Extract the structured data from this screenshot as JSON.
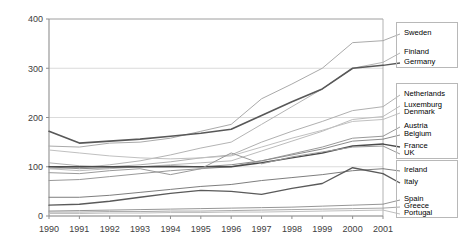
{
  "chart_data": {
    "type": "line",
    "title": "",
    "xlabel": "",
    "ylabel": "",
    "x": [
      1990,
      1991,
      1992,
      1993,
      1994,
      1995,
      1996,
      1997,
      1998,
      1999,
      2000,
      2001
    ],
    "categories": [
      "1990",
      "1991",
      "1992",
      "1993",
      "1994",
      "1995",
      "1996",
      "1997",
      "1998",
      "1999",
      "2000",
      "2001"
    ],
    "ylim": [
      0,
      400
    ],
    "xlim": [
      1990,
      2001
    ],
    "yticks": [
      0,
      100,
      200,
      300,
      400
    ],
    "ytick_labels": [
      "0",
      "100",
      "200",
      "300",
      "400"
    ],
    "grid": true,
    "legend_position": "right",
    "series": [
      {
        "name": "Sweden",
        "color": "#aaaaaa",
        "width": 1.0,
        "values": [
          142,
          140,
          148,
          150,
          158,
          172,
          186,
          238,
          268,
          300,
          352,
          356
        ]
      },
      {
        "name": "Finland",
        "color": "#b4b4b4",
        "width": 1.0,
        "values": [
          96,
          98,
          104,
          112,
          124,
          138,
          150,
          186,
          222,
          258,
          300,
          312
        ]
      },
      {
        "name": "Germany",
        "color": "#585858",
        "width": 1.6,
        "values": [
          172,
          148,
          152,
          156,
          162,
          168,
          176,
          204,
          232,
          258,
          300,
          306
        ]
      },
      {
        "name": "Netherlands",
        "color": "#b0b0b0",
        "width": 1.0,
        "values": [
          108,
          102,
          100,
          104,
          110,
          118,
          124,
          150,
          172,
          192,
          214,
          222
        ]
      },
      {
        "name": "Luxemburg",
        "color": "#bcbcbc",
        "width": 1.0,
        "values": [
          96,
          92,
          96,
          100,
          104,
          108,
          112,
          132,
          152,
          172,
          196,
          202
        ]
      },
      {
        "name": "Denmark",
        "color": "#c0c0c0",
        "width": 1.0,
        "values": [
          134,
          128,
          122,
          118,
          116,
          118,
          122,
          140,
          158,
          174,
          192,
          196
        ]
      },
      {
        "name": "Austria",
        "color": "#999999",
        "width": 1.0,
        "values": [
          72,
          74,
          80,
          86,
          92,
          96,
          100,
          112,
          126,
          140,
          158,
          162
        ]
      },
      {
        "name": "Belgium",
        "color": "#8c8c8c",
        "width": 1.0,
        "values": [
          100,
          96,
          98,
          100,
          102,
          100,
          104,
          112,
          124,
          136,
          152,
          156
        ]
      },
      {
        "name": "France",
        "color": "#4a4a4a",
        "width": 1.5,
        "values": [
          100,
          100,
          100,
          100,
          100,
          100,
          100,
          108,
          118,
          128,
          142,
          146
        ]
      },
      {
        "name": "UK",
        "color": "#9a9a9a",
        "width": 1.0,
        "values": [
          88,
          86,
          92,
          96,
          84,
          96,
          128,
          106,
          120,
          130,
          140,
          142
        ]
      },
      {
        "name": "Ireland",
        "color": "#7e7e7e",
        "width": 1.0,
        "values": [
          38,
          38,
          42,
          48,
          54,
          60,
          64,
          72,
          78,
          84,
          92,
          96
        ]
      },
      {
        "name": "Italy",
        "color": "#5a5a5a",
        "width": 1.4,
        "values": [
          22,
          24,
          30,
          38,
          46,
          52,
          50,
          44,
          56,
          66,
          98,
          86
        ]
      },
      {
        "name": "Spain",
        "color": "#969696",
        "width": 1.0,
        "values": [
          10,
          11,
          12,
          13,
          14,
          15,
          16,
          17,
          18,
          20,
          22,
          24
        ]
      },
      {
        "name": "Greece",
        "color": "#a8a8a8",
        "width": 1.0,
        "values": [
          8,
          8,
          9,
          9,
          10,
          10,
          11,
          12,
          13,
          14,
          15,
          16
        ]
      },
      {
        "name": "Portugal",
        "color": "#bfbfbf",
        "width": 1.0,
        "values": [
          5,
          5,
          6,
          6,
          7,
          7,
          8,
          8,
          9,
          10,
          11,
          12
        ]
      }
    ]
  },
  "legend": {
    "items": [
      {
        "label": "Sweden"
      },
      {
        "label": "Finland"
      },
      {
        "label": "Germany"
      },
      {
        "label": "Netherlands"
      },
      {
        "label": "Luxemburg"
      },
      {
        "label": "Denmark"
      },
      {
        "label": "Austria"
      },
      {
        "label": "Belgium"
      },
      {
        "label": "France"
      },
      {
        "label": "UK"
      },
      {
        "label": "Ireland"
      },
      {
        "label": "Italy"
      },
      {
        "label": "Spain"
      },
      {
        "label": "Greece"
      },
      {
        "label": "Portugal"
      }
    ]
  },
  "axes": {
    "y_labels": [
      "400",
      "300",
      "200",
      "100",
      "0"
    ],
    "x_labels": [
      "1990",
      "1991",
      "1992",
      "1993",
      "1994",
      "1995",
      "1996",
      "1997",
      "1998",
      "1999",
      "2000",
      "2001"
    ]
  },
  "colors": {
    "frame": "#a9a9a9",
    "grid": "#d2d2d2",
    "text": "#404040",
    "background": "#ffffff"
  }
}
